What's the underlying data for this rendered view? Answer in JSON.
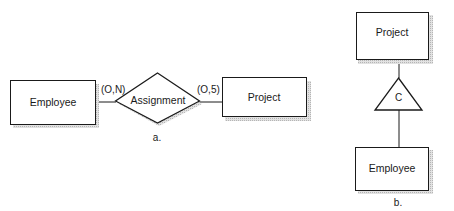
{
  "diagram_a": {
    "entity_left": "Employee",
    "relationship": "Assignment",
    "entity_right": "Project",
    "cardinality_left": "(O,N)",
    "cardinality_right": "(O,5)",
    "caption": "a."
  },
  "diagram_b": {
    "entity_top": "Project",
    "constraint_symbol": "C",
    "entity_bottom": "Employee",
    "caption": "b."
  },
  "colors": {
    "stroke": "#1a1a1a",
    "shadow": "#c8c8c8",
    "background": "#ffffff"
  }
}
